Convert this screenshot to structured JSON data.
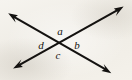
{
  "figure": {
    "background_color": "#f3f1ec",
    "stroke_color": "#141210",
    "label_color": "#15130f",
    "width": 132,
    "height": 80,
    "intersection": {
      "label": "intersection-point",
      "x": 60,
      "y": 43
    },
    "lines": [
      {
        "name": "line-upper-left-to-lower-right",
        "start": {
          "x": 9,
          "y": 14
        },
        "end": {
          "x": 110,
          "y": 72
        },
        "arrow_start": true,
        "arrow_end": true,
        "stroke_width": 2.1
      },
      {
        "name": "line-lower-left-to-upper-right",
        "start": {
          "x": 14,
          "y": 68
        },
        "end": {
          "x": 123,
          "y": 7
        },
        "arrow_start": true,
        "arrow_end": true,
        "stroke_width": 2.1
      }
    ],
    "labels": [
      {
        "id": "a",
        "text": "a",
        "position": "top",
        "x": 60,
        "y": 31
      },
      {
        "id": "b",
        "text": "b",
        "position": "right",
        "x": 77,
        "y": 45
      },
      {
        "id": "c",
        "text": "c",
        "position": "bottom",
        "x": 58,
        "y": 55
      },
      {
        "id": "d",
        "text": "d",
        "position": "left",
        "x": 41,
        "y": 45
      }
    ]
  }
}
